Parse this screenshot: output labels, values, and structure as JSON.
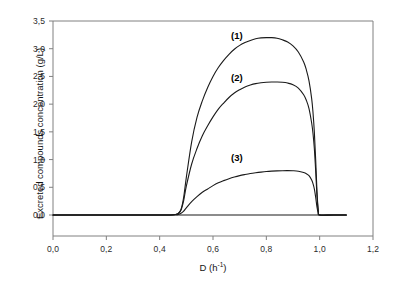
{
  "figure": {
    "background_color": "#ffffff",
    "axis_color": "#808080",
    "curve_color": "#1a1a1a"
  },
  "chart_data": {
    "type": "line",
    "title": "",
    "xlabel": "D (h-1)",
    "xlabel_base": "D (h",
    "xlabel_sup": "-1",
    "xlabel_close": ")",
    "ylabel": "Excreted compounds concentration (g/L)",
    "xlim": [
      0.0,
      1.2
    ],
    "ylim": [
      0.0,
      3.5
    ],
    "xticks": [
      0.0,
      0.2,
      0.4,
      0.6,
      0.8,
      1.0,
      1.2
    ],
    "yticks": [
      0.0,
      0.5,
      1.0,
      1.5,
      2.0,
      2.5,
      3.0,
      3.5
    ],
    "xtick_labels": [
      "0,0",
      "0,2",
      "0,4",
      "0,6",
      "0,8",
      "1,0",
      "1,2"
    ],
    "ytick_labels": [
      "0,0",
      "0,5",
      "1,0",
      "1,5",
      "2,0",
      "2,5",
      "3,0",
      "3,5"
    ],
    "grid": false,
    "legend_position": "inline-annotations",
    "decimal_separator": ",",
    "annotations": [
      {
        "text": "(1)",
        "x": 0.67,
        "y": 3.26,
        "series": "curve-1"
      },
      {
        "text": "(2)",
        "x": 0.67,
        "y": 2.52,
        "series": "curve-2"
      },
      {
        "text": "(3)",
        "x": 0.67,
        "y": 1.1,
        "series": "curve-3"
      }
    ],
    "series": [
      {
        "name": "(1)",
        "label": "(1)",
        "peak_x": 0.82,
        "peak_y": 3.2,
        "onset_x": 0.47,
        "washout_x": 0.99,
        "x": [
          0.0,
          0.1,
          0.2,
          0.3,
          0.4,
          0.44,
          0.46,
          0.47,
          0.48,
          0.49,
          0.5,
          0.52,
          0.54,
          0.56,
          0.58,
          0.6,
          0.62,
          0.64,
          0.66,
          0.68,
          0.7,
          0.72,
          0.74,
          0.76,
          0.78,
          0.8,
          0.82,
          0.84,
          0.86,
          0.88,
          0.9,
          0.92,
          0.94,
          0.95,
          0.96,
          0.97,
          0.975,
          0.98,
          0.985,
          0.99,
          0.995,
          1.0,
          1.05,
          1.1
        ],
        "y": [
          0.0,
          0.0,
          0.0,
          0.0,
          0.0,
          0.0,
          0.01,
          0.03,
          0.1,
          0.32,
          0.68,
          1.32,
          1.76,
          2.06,
          2.3,
          2.5,
          2.66,
          2.79,
          2.9,
          2.99,
          3.06,
          3.11,
          3.15,
          3.18,
          3.195,
          3.2,
          3.2,
          3.19,
          3.16,
          3.12,
          3.05,
          2.94,
          2.76,
          2.62,
          2.42,
          2.1,
          1.85,
          1.5,
          1.0,
          0.42,
          0.08,
          0.0,
          0.0,
          0.0
        ]
      },
      {
        "name": "(2)",
        "label": "(2)",
        "peak_x": 0.84,
        "peak_y": 2.4,
        "onset_x": 0.47,
        "washout_x": 0.99,
        "x": [
          0.0,
          0.1,
          0.2,
          0.3,
          0.4,
          0.44,
          0.46,
          0.47,
          0.48,
          0.49,
          0.5,
          0.52,
          0.54,
          0.56,
          0.58,
          0.6,
          0.62,
          0.64,
          0.66,
          0.68,
          0.7,
          0.72,
          0.74,
          0.76,
          0.78,
          0.8,
          0.82,
          0.84,
          0.86,
          0.88,
          0.9,
          0.92,
          0.94,
          0.95,
          0.96,
          0.97,
          0.975,
          0.98,
          0.985,
          0.99,
          0.995,
          1.0,
          1.05,
          1.1
        ],
        "y": [
          0.0,
          0.0,
          0.0,
          0.0,
          0.0,
          0.0,
          0.01,
          0.03,
          0.09,
          0.26,
          0.52,
          0.92,
          1.2,
          1.43,
          1.61,
          1.77,
          1.91,
          2.02,
          2.12,
          2.2,
          2.26,
          2.31,
          2.345,
          2.37,
          2.385,
          2.395,
          2.4,
          2.4,
          2.395,
          2.38,
          2.35,
          2.29,
          2.17,
          2.07,
          1.92,
          1.66,
          1.47,
          1.2,
          0.8,
          0.34,
          0.06,
          0.0,
          0.0,
          0.0
        ]
      },
      {
        "name": "(3)",
        "label": "(3)",
        "peak_x": 0.85,
        "peak_y": 0.8,
        "onset_x": 0.47,
        "washout_x": 0.99,
        "x": [
          0.0,
          0.1,
          0.2,
          0.3,
          0.4,
          0.44,
          0.46,
          0.47,
          0.48,
          0.49,
          0.5,
          0.52,
          0.54,
          0.56,
          0.58,
          0.6,
          0.62,
          0.64,
          0.66,
          0.68,
          0.7,
          0.72,
          0.74,
          0.76,
          0.78,
          0.8,
          0.82,
          0.84,
          0.86,
          0.88,
          0.9,
          0.92,
          0.94,
          0.95,
          0.96,
          0.97,
          0.975,
          0.98,
          0.985,
          0.99,
          0.995,
          1.0,
          1.05,
          1.1
        ],
        "y": [
          0.0,
          0.0,
          0.0,
          0.0,
          0.0,
          0.0,
          0.005,
          0.01,
          0.03,
          0.07,
          0.13,
          0.24,
          0.33,
          0.41,
          0.47,
          0.53,
          0.58,
          0.62,
          0.655,
          0.685,
          0.71,
          0.73,
          0.748,
          0.762,
          0.774,
          0.784,
          0.791,
          0.796,
          0.799,
          0.8,
          0.798,
          0.79,
          0.765,
          0.745,
          0.71,
          0.63,
          0.565,
          0.47,
          0.32,
          0.14,
          0.025,
          0.0,
          0.0,
          0.0
        ]
      }
    ],
    "baseline_series": {
      "name": "zero-baseline",
      "x": [
        0.0,
        1.1
      ],
      "y": [
        0.0,
        0.0
      ]
    }
  }
}
